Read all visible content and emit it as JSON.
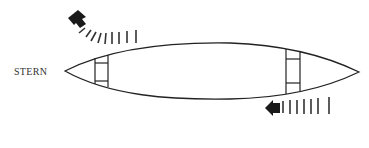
{
  "diagram": {
    "labels": {
      "stern": "STERN"
    },
    "elements": {
      "hull": "canoe-hull",
      "seats": [
        "stern-seat",
        "bow-seat"
      ],
      "arrows": [
        {
          "name": "stern-sweep-arrow",
          "direction": "up-left",
          "motion": "curved sweep"
        },
        {
          "name": "bow-draw-arrow",
          "direction": "left",
          "motion": "straight"
        }
      ]
    },
    "colors": {
      "line": "#222222",
      "arrow": "#1a1a1a",
      "background": "#ffffff",
      "text": "#333333"
    }
  }
}
